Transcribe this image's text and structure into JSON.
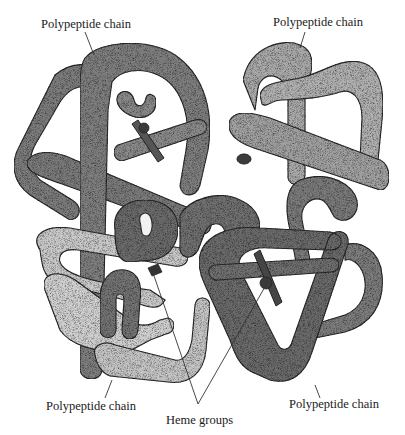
{
  "figure": {
    "labels": {
      "top_left": "Polypeptide chain",
      "top_right": "Polypeptide chain",
      "bottom_left": "Polypeptide chain",
      "bottom_right": "Polypeptide chain",
      "bottom_center": "Heme groups"
    },
    "colors": {
      "chain_dark": "#6e6e6e",
      "chain_mid": "#8a8a8a",
      "chain_light": "#b2b2b2",
      "chain_pale": "#cfcfcf",
      "heme": "#4a4a4a",
      "outline": "#2a2a2a",
      "background": "#ffffff"
    }
  }
}
